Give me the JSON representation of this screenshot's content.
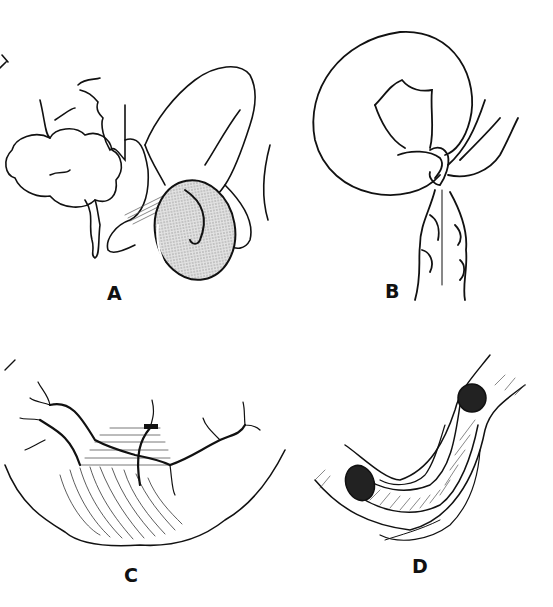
{
  "figure": {
    "panels": [
      {
        "id": "A",
        "label": "A",
        "description": "Bowel loop with shaded (stippled) distended segment"
      },
      {
        "id": "B",
        "label": "B",
        "description": "Looped bowel twisted around narrow mesenteric base"
      },
      {
        "id": "C",
        "label": "C",
        "description": "Bowel segment with mesenteric vessels and hatched ischemic zone, ligature marked"
      },
      {
        "id": "D",
        "label": "D",
        "description": "Longitudinally opened bowel segment showing telescoped inner lumen"
      }
    ],
    "colors": {
      "ink": "#111111",
      "background": "#ffffff",
      "stipple": "#c8c8c8"
    }
  }
}
